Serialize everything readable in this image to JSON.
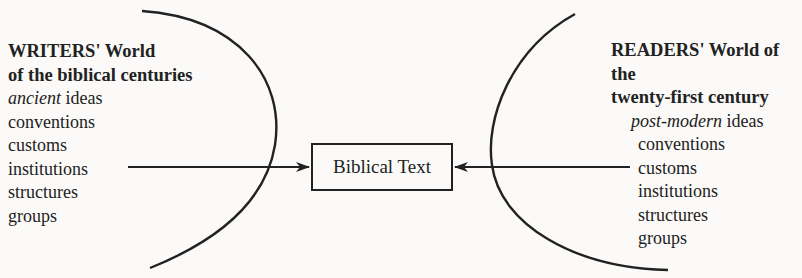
{
  "writers": {
    "title_line1": "WRITERS' World",
    "title_line2": "of the biblical centuries",
    "first_item_emph": "ancient",
    "first_item_rest": " ideas",
    "items": [
      "conventions",
      "customs",
      "institutions",
      "structures",
      "groups"
    ]
  },
  "readers": {
    "title_line1": "READERS' World of the",
    "title_line2": "twenty-first century",
    "first_item_emph": "post-modern",
    "first_item_rest": " ideas",
    "items": [
      "conventions",
      "customs",
      "institutions",
      "structures",
      "groups"
    ]
  },
  "center": {
    "label": "Biblical Text"
  },
  "colors": {
    "ink": "#222222",
    "background": "#fbfaf8"
  }
}
